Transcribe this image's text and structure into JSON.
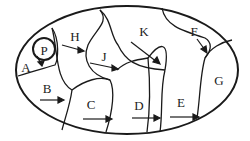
{
  "diagram": {
    "ellipse": {
      "cx": 127,
      "cy": 70,
      "rx": 111,
      "ry": 64
    },
    "regions": [
      {
        "id": "P",
        "label": "P",
        "x": 44,
        "y": 50
      },
      {
        "id": "A",
        "label": "A",
        "x": 26,
        "y": 67
      },
      {
        "id": "H",
        "label": "H",
        "x": 75,
        "y": 36
      },
      {
        "id": "B",
        "label": "B",
        "x": 47,
        "y": 88
      },
      {
        "id": "J",
        "label": "J",
        "x": 104,
        "y": 56
      },
      {
        "id": "C",
        "label": "C",
        "x": 91,
        "y": 104
      },
      {
        "id": "K",
        "label": "K",
        "x": 144,
        "y": 31
      },
      {
        "id": "D",
        "label": "D",
        "x": 139,
        "y": 105
      },
      {
        "id": "F",
        "label": "F",
        "x": 194,
        "y": 31
      },
      {
        "id": "E",
        "label": "E",
        "x": 181,
        "y": 102
      },
      {
        "id": "G",
        "label": "G",
        "x": 219,
        "y": 80
      }
    ],
    "colors": {
      "stroke": "#1a1a1a",
      "background": "#ffffff"
    }
  }
}
